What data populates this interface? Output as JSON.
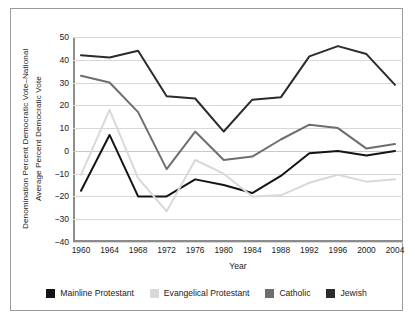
{
  "axes": {
    "ylabel_line1": "Denomination Percent Democratic Vote–National",
    "ylabel_line2": "Average Percent Democratic Vote",
    "xlabel": "Year",
    "yticks": [
      "50",
      "40",
      "30",
      "20",
      "10",
      "0",
      "−10",
      "−20",
      "−30",
      "−40"
    ]
  },
  "legend": {
    "items": [
      {
        "label": "Mainline Protestant",
        "color": "#141414"
      },
      {
        "label": "Evangelical Protestant",
        "color": "#d9d9d9"
      },
      {
        "label": "Catholic",
        "color": "#6e6e6e"
      },
      {
        "label": "Jewish",
        "color": "#2b2b2b"
      }
    ]
  },
  "chart_data": {
    "type": "line",
    "title": "",
    "xlabel": "Year",
    "ylabel": "Denomination Percent Democratic Vote–National Average Percent Democratic Vote",
    "categories": [
      1960,
      1964,
      1968,
      1972,
      1976,
      1980,
      1984,
      1988,
      1992,
      1996,
      2000,
      2004
    ],
    "ylim": [
      -40,
      50
    ],
    "ytick_values": [
      50,
      40,
      30,
      20,
      10,
      0,
      -10,
      -20,
      -30,
      -40
    ],
    "grid": true,
    "legend_position": "bottom",
    "series": [
      {
        "name": "Jewish",
        "color": "#2b2b2b",
        "values": [
          42,
          41,
          44,
          24,
          23,
          8.5,
          22.5,
          23.5,
          41.5,
          46,
          42.5,
          29
        ]
      },
      {
        "name": "Catholic",
        "color": "#6e6e6e",
        "values": [
          33,
          30,
          17,
          -8,
          8.5,
          -4,
          -2.5,
          5,
          11.5,
          10,
          1,
          3
        ]
      },
      {
        "name": "Mainline Protestant",
        "color": "#141414",
        "values": [
          -17.5,
          7,
          -20,
          -20,
          -12.5,
          -15,
          -18.5,
          -11,
          -1,
          0,
          -2,
          0
        ]
      },
      {
        "name": "Evangelical Protestant",
        "color": "#d9d9d9",
        "values": [
          -10.5,
          18,
          -12,
          -26.5,
          -4,
          -10,
          -20,
          -19.5,
          -14,
          -10.5,
          -13.5,
          -12.5
        ]
      }
    ]
  }
}
